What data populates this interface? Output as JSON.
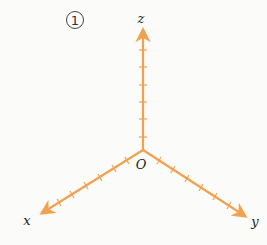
{
  "figure": {
    "index_label": "1",
    "axes_color": "#F2A14F",
    "origin": {
      "label": "O",
      "x": 143,
      "y": 150
    },
    "axes": [
      {
        "name": "z",
        "label": "z",
        "end": [
          143,
          27
        ],
        "ticks": 6
      },
      {
        "name": "x",
        "label": "x",
        "end": [
          40,
          214
        ],
        "ticks": 6
      },
      {
        "name": "y",
        "label": "y",
        "end": [
          247,
          217
        ],
        "ticks": 6
      }
    ]
  }
}
